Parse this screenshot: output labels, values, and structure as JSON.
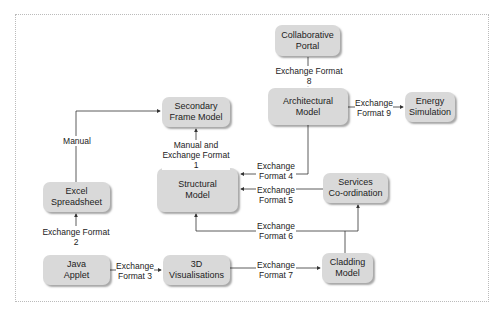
{
  "nodes": {
    "collaborative_portal": "Collaborative\nPortal",
    "architectural_model": "Architectural\nModel",
    "energy_simulation": "Energy\nSimulation",
    "secondary_frame_model": "Secondary\nFrame Model",
    "structural_model": "Structural\nModel",
    "excel_spreadsheet": "Excel\nSpreadsheet",
    "java_applet": "Java\nApplet",
    "visualisations_3d": "3D Visualisations",
    "services_coordination": "Services\nCo-ordination",
    "cladding_model": "Cladding\nModel"
  },
  "edges": {
    "manual": "Manual",
    "manual_ef1": "Manual and\nExchange Format 1",
    "ef2": "Exchange Format 2",
    "ef3": "Exchange\nFormat 3",
    "ef4": "Exchange\nFormat 4",
    "ef5": "Exchange\nFormat 5",
    "ef6": "Exchange\nFormat 6",
    "ef7": "Exchange\nFormat 7",
    "ef8": "Exchange Format 8",
    "ef9": "Exchange\nFormat 9"
  }
}
